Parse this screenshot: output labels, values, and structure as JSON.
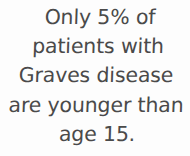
{
  "card": {
    "background_color": "#fdfdfd",
    "text_color": "#4a4a4a",
    "statement_full": "Only 5% of patients with Graves disease are younger than age 15.",
    "lines": [
      "Only 5% of",
      "patients with",
      "Graves disease",
      "are younger than",
      "age 15."
    ]
  }
}
